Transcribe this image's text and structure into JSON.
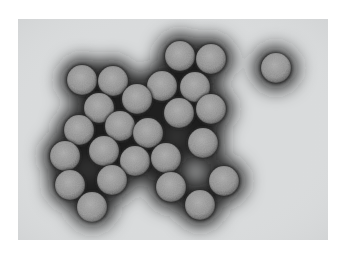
{
  "image": {
    "subject": "Electron micrograph of icosahedral virus particles",
    "background_color": "#ffffff",
    "field": {
      "x": 18,
      "y": 19,
      "width": 310,
      "height": 221,
      "color": "#d9dbdc"
    },
    "halo_color": "#1e1e1e",
    "particle_color": "#8c8c8c",
    "particle_highlight": "#b4b4b4",
    "particle_radius": 15,
    "particles": [
      {
        "cx": 82,
        "cy": 80
      },
      {
        "cx": 113,
        "cy": 81
      },
      {
        "cx": 162,
        "cy": 86
      },
      {
        "cx": 180,
        "cy": 56
      },
      {
        "cx": 211,
        "cy": 59
      },
      {
        "cx": 195,
        "cy": 87
      },
      {
        "cx": 276,
        "cy": 68
      },
      {
        "cx": 137,
        "cy": 99
      },
      {
        "cx": 99,
        "cy": 108
      },
      {
        "cx": 179,
        "cy": 113
      },
      {
        "cx": 211,
        "cy": 109
      },
      {
        "cx": 79,
        "cy": 130
      },
      {
        "cx": 120,
        "cy": 126
      },
      {
        "cx": 148,
        "cy": 133
      },
      {
        "cx": 203,
        "cy": 143
      },
      {
        "cx": 65,
        "cy": 156
      },
      {
        "cx": 104,
        "cy": 151
      },
      {
        "cx": 135,
        "cy": 161
      },
      {
        "cx": 166,
        "cy": 158
      },
      {
        "cx": 70,
        "cy": 185
      },
      {
        "cx": 112,
        "cy": 180
      },
      {
        "cx": 171,
        "cy": 187
      },
      {
        "cx": 224,
        "cy": 181
      },
      {
        "cx": 92,
        "cy": 207
      },
      {
        "cx": 200,
        "cy": 205
      }
    ]
  }
}
